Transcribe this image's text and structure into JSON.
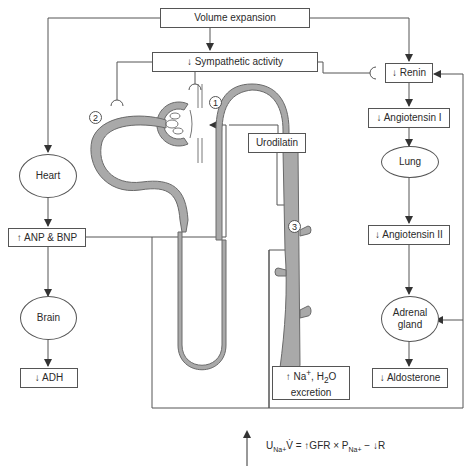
{
  "diagram": {
    "nodes": {
      "volume_expansion": "Volume expansion",
      "sympathetic": "↓ Sympathetic activity",
      "renin": "↓ Renin",
      "angiotensin_1": "↓ Angiotensin I",
      "lung": "Lung",
      "angiotensin_2": "↓ Angiotensin II",
      "adrenal_line1": "Adrenal",
      "adrenal_line2": "gland",
      "aldosterone": "↓ Aldosterone",
      "heart": "Heart",
      "anp_bnp": "↑ ANP & BNP",
      "brain": "Brain",
      "adh": "↓ ADH",
      "urodilatin": "Urodilatin",
      "excretion_line1_prefix": "↑ Na",
      "excretion_line1_sup": "+",
      "excretion_line1_mid": ", H",
      "excretion_line1_sub": "2",
      "excretion_line1_suffix": "O",
      "excretion_line2": "excretion"
    },
    "site_markers": [
      "1",
      "2",
      "3"
    ],
    "formula": {
      "u": "U",
      "u_sub": "Na+",
      "v": "V̇",
      "eq": " = ↑GFR × P",
      "p_sub": "Na+",
      "tail": " − ↓R"
    },
    "colors": {
      "tubule_fill": "#a9a9a9",
      "tubule_stroke": "#6a6a6a",
      "line": "#555555"
    }
  }
}
